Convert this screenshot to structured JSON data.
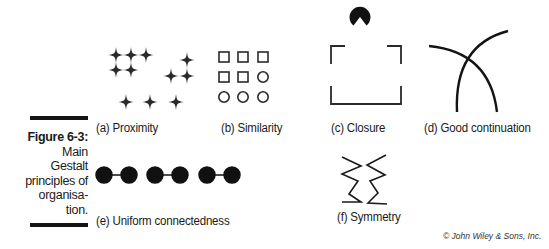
{
  "figure": {
    "number": "Figure 6-3:",
    "caption_lines": [
      "Main",
      "Gestalt",
      "principles of",
      "organisa-",
      "tion."
    ]
  },
  "panels": [
    {
      "id": "a",
      "label": "(a) Proximity",
      "principle": "Proximity",
      "shape": "four-point-star",
      "groups": [
        6,
        3,
        3
      ]
    },
    {
      "id": "b",
      "label": "(b) Similarity",
      "principle": "Similarity",
      "shape": "squares-and-circles",
      "grid": [
        [
          "square",
          "square",
          "square"
        ],
        [
          "square",
          "square",
          "circle"
        ],
        [
          "circle",
          "circle",
          "circle"
        ]
      ]
    },
    {
      "id": "c",
      "label": "(c) Closure",
      "principle": "Closure",
      "shape": "open-square-brackets-with-pacman"
    },
    {
      "id": "d",
      "label": "(d) Good continuation",
      "principle": "Good continuation",
      "shape": "two-crossing-arcs"
    },
    {
      "id": "e",
      "label": "(e) Uniform connectedness",
      "principle": "Uniform connectedness",
      "shape": "connected-dot-pairs",
      "pairs": 3
    },
    {
      "id": "f",
      "label": "(f) Symmetry",
      "principle": "Symmetry",
      "shape": "mirrored-zigzags"
    }
  ],
  "credit": "© John Wiley & Sons, Inc.",
  "colors": {
    "ink": "#141414",
    "background": "#ffffff"
  }
}
